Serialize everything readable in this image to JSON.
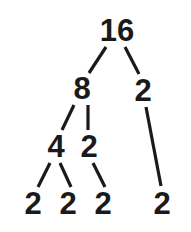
{
  "figure": {
    "background_color": "#ffffff",
    "stroke_color": "#1a1a1a",
    "text_color": "#1a1a1a",
    "stroke_width": 3
  },
  "tree": {
    "root_value": "16",
    "nodes": [
      {
        "id": "n16",
        "label": "16",
        "x": 117,
        "y": 30,
        "level": 0,
        "role": "root"
      },
      {
        "id": "n8",
        "label": "8",
        "x": 82,
        "y": 88,
        "level": 1,
        "role": "branch"
      },
      {
        "id": "n2a",
        "label": "2",
        "x": 143,
        "y": 90,
        "level": 1,
        "role": "prime"
      },
      {
        "id": "n4",
        "label": "4",
        "x": 56,
        "y": 146,
        "level": 2,
        "role": "branch"
      },
      {
        "id": "n2b",
        "label": "2",
        "x": 89,
        "y": 146,
        "level": 2,
        "role": "prime"
      },
      {
        "id": "n2c",
        "label": "2",
        "x": 33,
        "y": 203,
        "level": 3,
        "role": "prime"
      },
      {
        "id": "n2d",
        "label": "2",
        "x": 68,
        "y": 203,
        "level": 3,
        "role": "prime"
      },
      {
        "id": "n2e",
        "label": "2",
        "x": 103,
        "y": 203,
        "level": 3,
        "role": "prime"
      },
      {
        "id": "n2f",
        "label": "2",
        "x": 162,
        "y": 203,
        "level": 3,
        "role": "prime"
      }
    ],
    "edges": [
      {
        "id": "e-16-8",
        "from": "n16",
        "to": "n8",
        "x1": 106,
        "y1": 47,
        "x2": 89,
        "y2": 73
      },
      {
        "id": "e-16-2a",
        "from": "n16",
        "to": "n2a",
        "x1": 125,
        "y1": 47,
        "x2": 139,
        "y2": 74
      },
      {
        "id": "e-8-4",
        "from": "n8",
        "to": "n4",
        "x1": 74,
        "y1": 105,
        "x2": 62,
        "y2": 130
      },
      {
        "id": "e-8-2b",
        "from": "n8",
        "to": "n2b",
        "x1": 88,
        "y1": 105,
        "x2": 88,
        "y2": 130
      },
      {
        "id": "e-2a-2f",
        "from": "n2a",
        "to": "n2f",
        "x1": 146,
        "y1": 107,
        "x2": 161,
        "y2": 186
      },
      {
        "id": "e-4-2c",
        "from": "n4",
        "to": "n2c",
        "x1": 50,
        "y1": 163,
        "x2": 38,
        "y2": 187
      },
      {
        "id": "e-4-2d",
        "from": "n4",
        "to": "n2d",
        "x1": 60,
        "y1": 163,
        "x2": 71,
        "y2": 187
      },
      {
        "id": "e-2b-2e",
        "from": "n2b",
        "to": "n2e",
        "x1": 93,
        "y1": 163,
        "x2": 105,
        "y2": 187
      }
    ]
  }
}
